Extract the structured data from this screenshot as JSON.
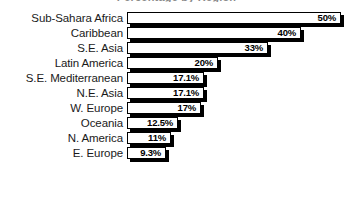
{
  "chart_data": {
    "type": "bar",
    "orientation": "horizontal",
    "title": "Percentage by Region",
    "xlabel": "",
    "ylabel": "",
    "grid": false,
    "legend": "none",
    "xlim": [
      0,
      50
    ],
    "categories": [
      "Sub-Sahara Africa",
      "Caribbean",
      "S.E. Asia",
      "Latin America",
      "S.E. Mediterranean",
      "N.E. Asia",
      "W. Europe",
      "Oceania",
      "N. America",
      "E. Europe"
    ],
    "values": [
      50,
      40,
      33,
      20,
      17.1,
      17.1,
      17,
      12.5,
      11,
      9.3
    ],
    "value_labels": [
      "50%",
      "40%",
      "33%",
      "20%",
      "17.1%",
      "17.1%",
      "17%",
      "12.5%",
      "11%",
      "9.3%"
    ],
    "bars": [
      {
        "label": "Sub-Sahara Africa",
        "value": 50,
        "value_label": "50%",
        "bar_px": 214
      },
      {
        "label": "Caribbean",
        "value": 40,
        "value_label": "40%",
        "bar_px": 174
      },
      {
        "label": "S.E. Asia",
        "value": 33,
        "value_label": "33%",
        "bar_px": 141
      },
      {
        "label": "Latin America",
        "value": 20,
        "value_label": "20%",
        "bar_px": 91
      },
      {
        "label": "S.E. Mediterranean",
        "value": 17.1,
        "value_label": "17.1%",
        "bar_px": 77
      },
      {
        "label": "N.E. Asia",
        "value": 17.1,
        "value_label": "17.1%",
        "bar_px": 77
      },
      {
        "label": "W. Europe",
        "value": 17,
        "value_label": "17%",
        "bar_px": 74
      },
      {
        "label": "Oceania",
        "value": 12.5,
        "value_label": "12.5%",
        "bar_px": 51
      },
      {
        "label": "N. America",
        "value": 11,
        "value_label": "11%",
        "bar_px": 44
      },
      {
        "label": "E. Europe",
        "value": 9.3,
        "value_label": "9.3%",
        "bar_px": 39
      }
    ],
    "colors": {
      "bar_fill": "#ffffff",
      "bar_border": "#000000",
      "bar_shadow": "#000000",
      "background": "#ffffff",
      "label_text": "#1a1a1a",
      "value_text": "#000000"
    }
  }
}
